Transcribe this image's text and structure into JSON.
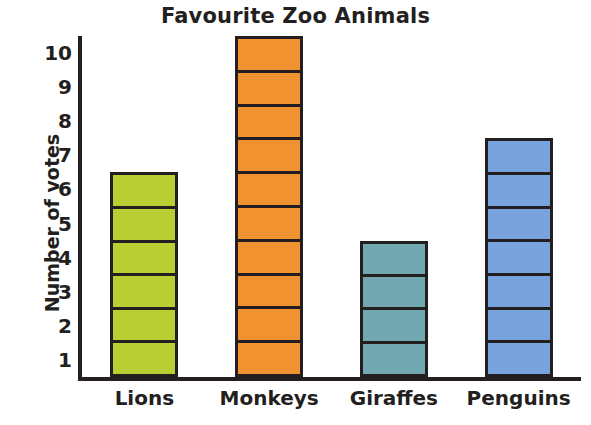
{
  "chart_data": {
    "type": "bar",
    "title": "Favourite Zoo Animals",
    "xlabel": "",
    "ylabel": "Number of votes",
    "categories": [
      "Lions",
      "Monkeys",
      "Giraffes",
      "Penguins"
    ],
    "values": [
      6,
      10,
      4,
      7
    ],
    "ylim": [
      0,
      10
    ],
    "yticks": [
      10,
      9,
      8,
      7,
      6,
      5,
      4,
      3,
      2,
      1
    ],
    "grid": false,
    "legend": null,
    "bar_style": "segmented-unit-blocks",
    "colors": {
      "Lions": "#b8ce33",
      "Monkeys": "#f0922f",
      "Giraffes": "#72a8b0",
      "Penguins": "#78a3dd",
      "outline": "#231f20",
      "text": "#231f20",
      "background": "#ffffff"
    },
    "series": [
      {
        "name": "votes",
        "points": [
          {
            "category": "Lions",
            "value": 6,
            "color": "#b8ce33"
          },
          {
            "category": "Monkeys",
            "value": 10,
            "color": "#f0922f"
          },
          {
            "category": "Giraffes",
            "value": 4,
            "color": "#72a8b0"
          },
          {
            "category": "Penguins",
            "value": 7,
            "color": "#78a3dd"
          }
        ]
      }
    ]
  }
}
